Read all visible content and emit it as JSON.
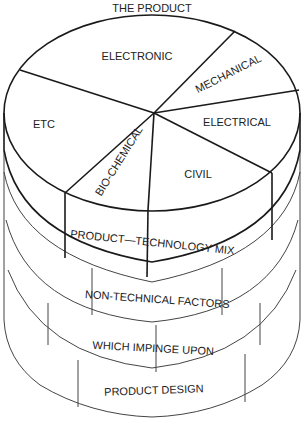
{
  "title": "THE PRODUCT",
  "pie": {
    "segments": [
      {
        "label": "ELECTRONIC"
      },
      {
        "label": "MECHANICAL"
      },
      {
        "label": "ELECTRICAL"
      },
      {
        "label": "CIVIL"
      },
      {
        "label": "BIO-CHEMICAL"
      },
      {
        "label": "ETC"
      }
    ]
  },
  "bands": [
    {
      "label": "PRODUCT—TECHNOLOGY MIX"
    },
    {
      "label": "NON-TECHNICAL FACTORS"
    },
    {
      "label": "WHICH IMPINGE UPON"
    },
    {
      "label": "PRODUCT DESIGN"
    }
  ],
  "colors": {
    "line": "#1a1a1a",
    "text": "#222222",
    "background": "#ffffff"
  }
}
